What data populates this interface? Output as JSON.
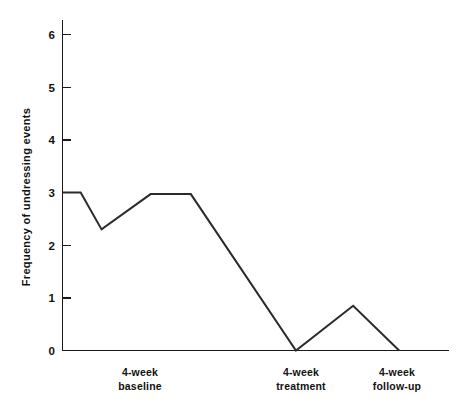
{
  "chart_data": {
    "type": "line",
    "title": "",
    "xlabel": "",
    "ylabel": "Frequency of undressing events",
    "ylim": [
      0,
      6.4
    ],
    "yticks": [
      0,
      1,
      2,
      3,
      4,
      5,
      6
    ],
    "ytick_labels": [
      "0",
      "1",
      "2",
      "3",
      "4",
      "5",
      "6"
    ],
    "grid": false,
    "legend": false,
    "xtick_labels": [
      {
        "line1": "4-week",
        "line2": "baseline"
      },
      {
        "line1": "4-week",
        "line2": "treatment"
      },
      {
        "line1": "4-week",
        "line2": "follow-up"
      }
    ],
    "phases": [
      "4-week baseline",
      "4-week treatment",
      "4-week follow-up"
    ],
    "series": [
      {
        "name": "Frequency of undressing events",
        "color": "#2b2b2b",
        "x": [
          0.0,
          0.47,
          1.01,
          2.28,
          3.32,
          6.04,
          7.52,
          8.71
        ],
        "values": [
          3.0,
          3.0,
          2.3,
          2.97,
          2.97,
          0.0,
          0.85,
          0.0
        ]
      }
    ],
    "vertices": [
      {
        "x": 0.0,
        "y": 3.0
      },
      {
        "x": 0.47,
        "y": 3.0
      },
      {
        "x": 1.01,
        "y": 2.3
      },
      {
        "x": 2.28,
        "y": 2.97
      },
      {
        "x": 3.32,
        "y": 2.97
      },
      {
        "x": 6.04,
        "y": 0.0
      },
      {
        "x": 7.52,
        "y": 0.85
      },
      {
        "x": 8.71,
        "y": 0.0
      }
    ],
    "xlim": [
      0,
      10.0
    ]
  }
}
